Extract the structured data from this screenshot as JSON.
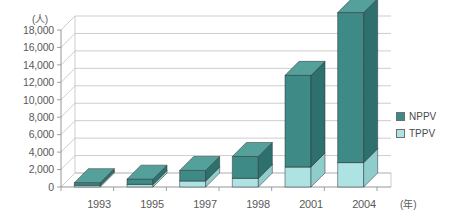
{
  "top_partial_text": {
    "left_fragment": "",
    "right_fragment": ""
  },
  "axes": {
    "y_unit": "(人)",
    "x_unit": "(年)",
    "y_ticks": [
      "18,000",
      "16,000",
      "14,000",
      "12,000",
      "10,000",
      "8,000",
      "6,000",
      "4,000",
      "2,000",
      "0"
    ]
  },
  "legend": {
    "items": [
      {
        "label": "NPPV",
        "color": "#3d8a86"
      },
      {
        "label": "TPPV",
        "color": "#aee3e3"
      }
    ]
  },
  "colors": {
    "nppv_face": "#3d8a86",
    "nppv_side": "#2e706d",
    "nppv_top": "#54a09b",
    "tppv_face": "#aee3e3",
    "tppv_side": "#8fcdcd",
    "tppv_top": "#c8eeee",
    "grid": "#b8b8b8",
    "axis": "#8a8a8a",
    "text": "#5a5a5a"
  },
  "chart_data": {
    "type": "bar",
    "subtype": "stacked-3d-column",
    "title": "",
    "xlabel": "(年)",
    "ylabel": "(人)",
    "ylim": [
      0,
      18000
    ],
    "ytick_step": 2000,
    "grid": true,
    "legend_position": "right",
    "categories": [
      "1993",
      "1995",
      "1997",
      "1998",
      "2001",
      "2004"
    ],
    "series": [
      {
        "name": "TPPV",
        "color": "#aee3e3",
        "values": [
          200,
          300,
          700,
          1000,
          2300,
          2800
        ]
      },
      {
        "name": "NPPV",
        "color": "#3d8a86",
        "values": [
          300,
          600,
          1200,
          2500,
          10500,
          17200
        ]
      }
    ],
    "totals": [
      500,
      900,
      1900,
      3500,
      12800,
      20000
    ]
  }
}
